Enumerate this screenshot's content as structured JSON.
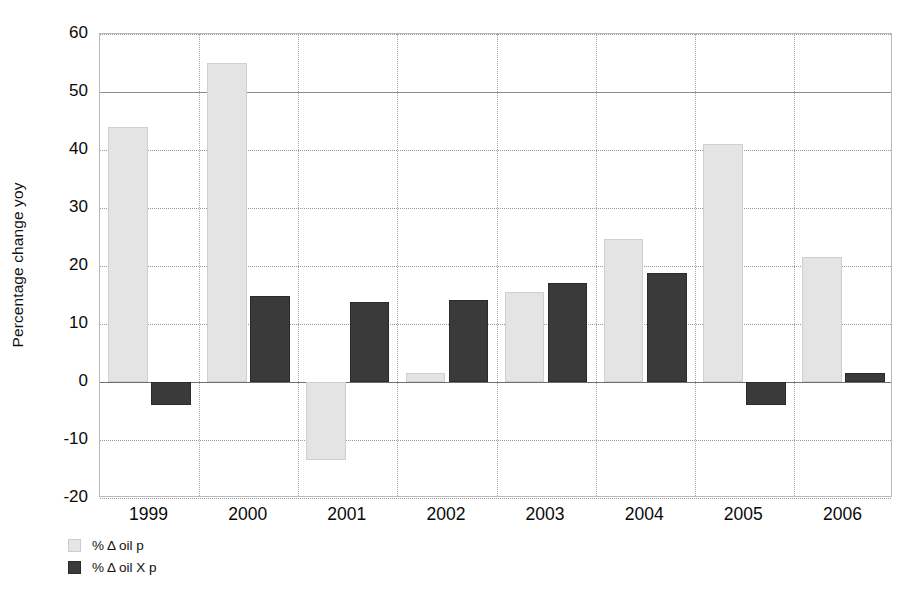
{
  "chart_data": {
    "type": "bar",
    "title": "",
    "subtitle": "",
    "xlabel": "",
    "ylabel": "Percentage change yoy",
    "categories": [
      "1999",
      "2000",
      "2001",
      "2002",
      "2003",
      "2004",
      "2005",
      "2006"
    ],
    "series": [
      {
        "name": "% Δ oil p",
        "color": "#e4e4e4",
        "values": [
          44,
          55,
          -13.5,
          1.5,
          15.6,
          24.6,
          41,
          21.6
        ]
      },
      {
        "name": "% Δ oil X p",
        "color": "#3a3a3a",
        "values": [
          -4,
          14.8,
          13.8,
          14.2,
          17,
          18.8,
          -4,
          1.5
        ]
      }
    ],
    "ylim": [
      -20,
      60
    ],
    "yticks": [
      60,
      50,
      40,
      30,
      20,
      10,
      0,
      -10,
      -20
    ],
    "ytick_labels": [
      "60",
      "50",
      "40",
      "30",
      "20",
      "10",
      "0",
      "-10",
      "-20"
    ],
    "grid": true,
    "grid_axis": "both",
    "legend_position": "below-left",
    "zero_line": 0
  },
  "legend": {
    "items": [
      {
        "label": "% Δ oil p",
        "swatch": "light-grey-swatch"
      },
      {
        "label": "% Δ oil X p",
        "swatch": "dark-grey-swatch"
      }
    ]
  }
}
